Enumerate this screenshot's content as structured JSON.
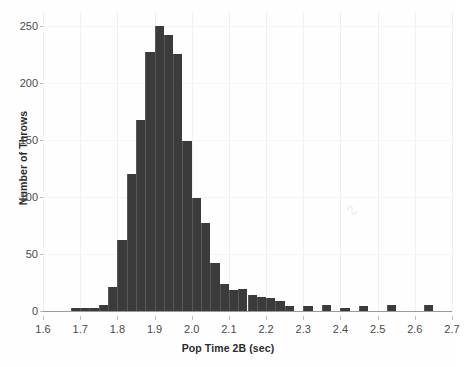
{
  "chart_data": {
    "type": "bar",
    "title": "",
    "subtitle": "",
    "xlabel": "Pop Time 2B (sec)",
    "ylabel": "Number of Throws",
    "xlim": [
      1.6,
      2.7
    ],
    "ylim": [
      0,
      262
    ],
    "grid": true,
    "legend": null,
    "bin_width": 0.025,
    "xticks": [
      1.6,
      1.7,
      1.8,
      1.9,
      2.0,
      2.1,
      2.2,
      2.3,
      2.4,
      2.5,
      2.6,
      2.7
    ],
    "xtick_labels": [
      "1.6",
      "1.7",
      "1.8",
      "1.9",
      "2.0",
      "2.1",
      "2.2",
      "2.3",
      "2.4",
      "2.5",
      "2.6",
      "2.7"
    ],
    "yticks": [
      0,
      50,
      100,
      150,
      200,
      250
    ],
    "ytick_labels": [
      "0",
      "50",
      "100",
      "150",
      "200",
      "250"
    ],
    "bar_color": "#3b3b3b",
    "bin_starts": [
      1.675,
      1.7,
      1.725,
      1.75,
      1.775,
      1.8,
      1.825,
      1.85,
      1.875,
      1.9,
      1.925,
      1.95,
      1.975,
      2.0,
      2.025,
      2.05,
      2.075,
      2.1,
      2.125,
      2.15,
      2.175,
      2.2,
      2.225,
      2.25,
      2.275,
      2.3,
      2.325,
      2.35,
      2.375,
      2.4,
      2.45,
      2.525,
      2.625
    ],
    "values": [
      3,
      3,
      3,
      5,
      21,
      62,
      120,
      167,
      227,
      250,
      242,
      225,
      149,
      99,
      77,
      42,
      24,
      18,
      19,
      14,
      12,
      11,
      9,
      4,
      0,
      4,
      0,
      5,
      0,
      3,
      4,
      5,
      5
    ],
    "categories": [
      "1.675-1.700",
      "1.700-1.725",
      "1.725-1.750",
      "1.750-1.775",
      "1.775-1.800",
      "1.800-1.825",
      "1.825-1.850",
      "1.850-1.875",
      "1.875-1.900",
      "1.900-1.925",
      "1.925-1.950",
      "1.950-1.975",
      "1.975-2.000",
      "2.000-2.025",
      "2.025-2.050",
      "2.050-2.075",
      "2.075-2.100",
      "2.100-2.125",
      "2.125-2.150",
      "2.150-2.175",
      "2.175-2.200",
      "2.200-2.225",
      "2.225-2.250",
      "2.250-2.275",
      "2.275-2.300",
      "2.300-2.325",
      "2.325-2.350",
      "2.350-2.375",
      "2.375-2.400",
      "2.400-2.425",
      "2.450-2.475",
      "2.525-2.550",
      "2.625-2.650"
    ]
  }
}
